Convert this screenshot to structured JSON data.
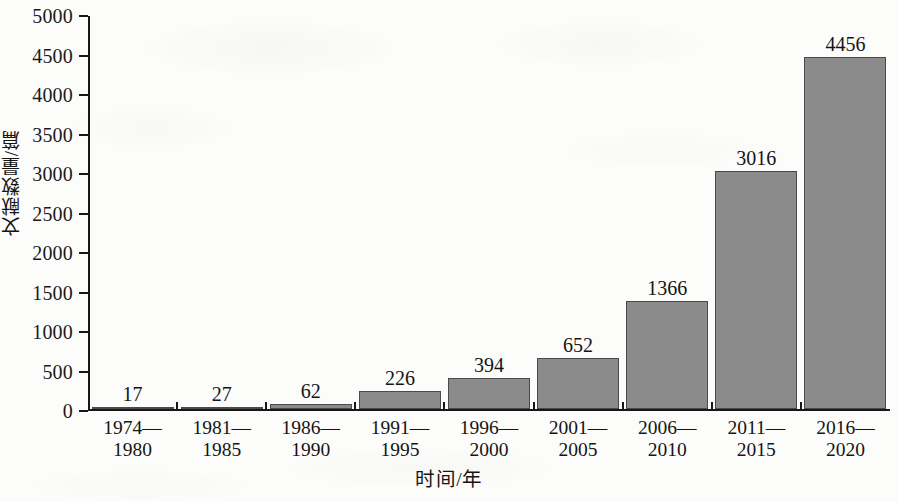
{
  "chart_data": {
    "type": "bar",
    "title": "",
    "subtitle": "",
    "xlabel": "时间/年",
    "ylabel": "文献数量/篇",
    "categories": [
      "1974—1980",
      "1981—1985",
      "1986—1990",
      "1991—1995",
      "1996—2000",
      "2001—2005",
      "2006—2010",
      "2011—2015",
      "2016—2020"
    ],
    "category_lines": [
      [
        "1974—",
        "1980"
      ],
      [
        "1981—",
        "1985"
      ],
      [
        "1986—",
        "1990"
      ],
      [
        "1991—",
        "1995"
      ],
      [
        "1996—",
        "2000"
      ],
      [
        "2001—",
        "2005"
      ],
      [
        "2006—",
        "2010"
      ],
      [
        "2011—",
        "2015"
      ],
      [
        "2016—",
        "2020"
      ]
    ],
    "values": [
      17,
      27,
      62,
      226,
      394,
      652,
      1366,
      3016,
      4456
    ],
    "value_labels": [
      "17",
      "27",
      "62",
      "226",
      "394",
      "652",
      "1366",
      "3016",
      "4456"
    ],
    "ylim": [
      0,
      5000
    ],
    "y_ticks": [
      0,
      500,
      1000,
      1500,
      2000,
      2500,
      3000,
      3500,
      4000,
      4500,
      5000
    ],
    "y_tick_labels": [
      "0",
      "500",
      "1000",
      "1500",
      "2000",
      "2500",
      "3000",
      "3500",
      "4000",
      "4500",
      "5000"
    ],
    "grid": false,
    "legend": null,
    "legend_position": "none",
    "bar_color": "#8b8b8b",
    "bar_edge_color": "#4a4a4a",
    "axis_color": "#171717",
    "text_color": "#151515",
    "background_color": "#fcfcfa"
  }
}
